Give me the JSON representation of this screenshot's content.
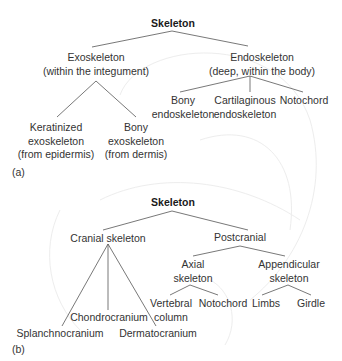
{
  "panel_a": {
    "tag": "(a)",
    "root": "Skeleton",
    "exoskeleton": {
      "line1": "Exoskeleton",
      "line2": "(within the integument)"
    },
    "endoskeleton": {
      "line1": "Endoskeleton",
      "line2": "(deep, within the body)"
    },
    "keratinized": {
      "line1": "Keratinized",
      "line2": "exoskeleton",
      "line3": "(from epidermis)"
    },
    "bony_exo": {
      "line1": "Bony",
      "line2": "exoskeleton",
      "line3": "(from dermis)"
    },
    "bony_endo": {
      "line1": "Bony",
      "line2": "endoskeleton"
    },
    "cartilaginous": {
      "line1": "Cartilaginous",
      "line2": "endoskeleton"
    },
    "notochord": "Notochord"
  },
  "panel_b": {
    "tag": "(b)",
    "root": "Skeleton",
    "cranial": "Cranial skeleton",
    "postcranial": "Postcranial",
    "axial": {
      "line1": "Axial",
      "line2": "skeleton"
    },
    "appendicular": {
      "line1": "Appendicular",
      "line2": "skeleton"
    },
    "vertebral": {
      "line1": "Vertebral",
      "line2": "column"
    },
    "notochord": "Notochord",
    "limbs": "Limbs",
    "girdle": "Girdle",
    "chondrocranium": "Chondrocranium",
    "splanchnocranium": "Splanchnocranium",
    "dermatocranium": "Dermatocranium"
  },
  "colors": {
    "line": "#555555",
    "text": "#333333",
    "watermark": "#ececec"
  }
}
